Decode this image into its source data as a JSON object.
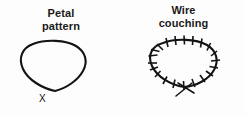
{
  "figure": {
    "title": "",
    "background_color": "#fdfdfd",
    "ink_color": "#131313",
    "panels": [
      {
        "id": "petal-pattern",
        "title": "Petal\npattern",
        "title_line_1": "Petal",
        "title_line_2": "pattern",
        "shape_name": "petal-loop",
        "shape_description": "closed teardrop loop coming to a soft point at the bottom",
        "has_tick_marks": false,
        "has_crossed_tails": false,
        "base_label": "X"
      },
      {
        "id": "wire-couching",
        "title": "Wire\ncouching",
        "title_line_1": "Wire",
        "title_line_2": "couching",
        "shape_name": "couched-loop",
        "shape_description": "closed teardrop loop with perpendicular couching stitches and crossed wire tails at the bottom",
        "has_tick_marks": true,
        "tick_count": 19,
        "has_crossed_tails": true,
        "base_label": "X"
      }
    ]
  },
  "icons": {
    "petal_loop": "petal-loop-icon",
    "couched_loop": "couched-loop-icon",
    "tick": "couching-stitch-tick-icon",
    "tails": "wire-tail-cross-icon"
  }
}
